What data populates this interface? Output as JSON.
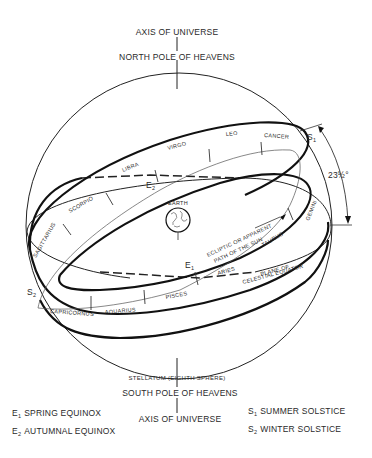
{
  "top": {
    "axis_label": "AXIS OF UNIVERSE",
    "pole_label": "NORTH POLE OF HEAVENS"
  },
  "bottom": {
    "sphere_label": "STELLATUM (EIGHTH SPHERE)",
    "pole_label": "SOUTH POLE OF HEAVENS",
    "axis_label": "AXIS OF UNIVERSE"
  },
  "center": {
    "earth_label": "EARTH"
  },
  "zodiac": [
    {
      "name": "CANCER"
    },
    {
      "name": "LEO"
    },
    {
      "name": "VIRGO"
    },
    {
      "name": "LIBRA"
    },
    {
      "name": "SCORPIO"
    },
    {
      "name": "SAGITTARIUS"
    },
    {
      "name": "CAPRICORNUS"
    },
    {
      "name": "AQUARIUS"
    },
    {
      "name": "PISCES"
    },
    {
      "name": "ARIES"
    },
    {
      "name": "TAURUS"
    },
    {
      "name": "GEMINI"
    }
  ],
  "markers": {
    "e1": "E",
    "e1_sub": "1",
    "e2": "E",
    "e2_sub": "2",
    "s1": "S",
    "s1_sub": "1",
    "s2": "S",
    "s2_sub": "2"
  },
  "annotations": {
    "ecliptic_line1": "ECLIPTIC OR APPARENT",
    "ecliptic_line2": "PATH OF THE SUN",
    "equator_line1": "PLANE OF",
    "equator_line2": "CELESTIAL EQUATOR",
    "angle": "23½°"
  },
  "legend": {
    "left": [
      {
        "symbol": "E",
        "sub": "1",
        "text": "SPRING EQUINOX"
      },
      {
        "symbol": "E",
        "sub": "2",
        "text": "AUTUMNAL EQUINOX"
      }
    ],
    "right": [
      {
        "symbol": "S",
        "sub": "1",
        "text": "SUMMER SOLSTICE"
      },
      {
        "symbol": "S",
        "sub": "2",
        "text": "WINTER SOLSTICE"
      }
    ]
  },
  "colors": {
    "ink": "#111111",
    "background": "#ffffff"
  }
}
